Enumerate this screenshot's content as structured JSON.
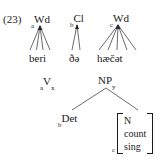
{
  "figure": {
    "example_number": "(23)",
    "caption": ""
  },
  "prosodic_tier": {
    "nodes": [
      {
        "index": "a",
        "label": "Wd",
        "terminal": "beri"
      },
      {
        "index": "b",
        "label": "Cl",
        "terminal": "ðə"
      },
      {
        "index": "c",
        "label": "Wd",
        "terminal": "hæčət"
      }
    ]
  },
  "syntactic_tier": {
    "verb": {
      "index": "a",
      "label": "V",
      "subscript": "x"
    },
    "np": {
      "label": "NP",
      "subscript": "y"
    },
    "det": {
      "index": "b",
      "label": "Det"
    },
    "noun_matrix": {
      "index": "c",
      "features": [
        "N",
        "count",
        "sing"
      ]
    }
  },
  "colors": {
    "ink": "#1a1a1a",
    "line": "#2b2b2b",
    "background": "#ffffff"
  }
}
